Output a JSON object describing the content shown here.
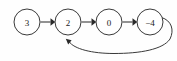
{
  "diagram": {
    "type": "directed-graph",
    "title": "",
    "background_color": "#fefefe",
    "node_stroke_color": "#3a3a3a",
    "node_fill_color": "#ffffff",
    "edge_color": "#4a4a4a",
    "label_color": "#1a1a1a",
    "nodes": [
      {
        "id": "n0",
        "label": "3",
        "cx": 27,
        "cy": 22,
        "r": 13
      },
      {
        "id": "n1",
        "label": "2",
        "cx": 68,
        "cy": 22,
        "r": 13
      },
      {
        "id": "n2",
        "label": "0",
        "cx": 109,
        "cy": 22,
        "r": 13
      },
      {
        "id": "n3",
        "label": "−4",
        "cx": 150,
        "cy": 22,
        "r": 13
      }
    ],
    "edges": [
      {
        "id": "e0",
        "from": "3",
        "to": "2",
        "kind": "straight",
        "label": ""
      },
      {
        "id": "e1",
        "from": "2",
        "to": "0",
        "kind": "straight",
        "label": ""
      },
      {
        "id": "e2",
        "from": "0",
        "to": "−4",
        "kind": "straight",
        "label": ""
      },
      {
        "id": "e3",
        "from": "−4",
        "to": "2",
        "kind": "curved-back",
        "label": ""
      }
    ]
  }
}
